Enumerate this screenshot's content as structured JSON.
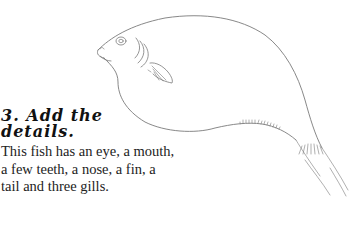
{
  "step": {
    "heading_line1": "3. Add the",
    "heading_line2": "details.",
    "body": "This fish has an eye, a mouth, a few teeth, a nose, a fin, a tail and three gills."
  },
  "illustration": {
    "subject": "fish-outline-drawing",
    "stroke_color": "#7a7a7a",
    "details": [
      "eye",
      "mouth",
      "teeth",
      "nose",
      "fin",
      "tail",
      "three gills"
    ]
  }
}
